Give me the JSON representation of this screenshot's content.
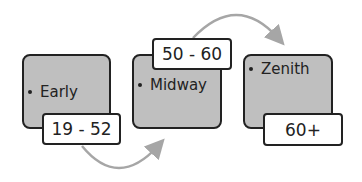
{
  "diagram": {
    "type": "process",
    "stages": [
      {
        "label": "Early",
        "range": "19 - 52"
      },
      {
        "label": "Midway",
        "range": "50 - 60"
      },
      {
        "label": "Zenith",
        "range": "60+"
      }
    ],
    "colors": {
      "block_fill": "#bfbfbf",
      "block_border": "#222222",
      "tag_fill": "#ffffff",
      "arrow": "#a6a6a6",
      "text": "#222222"
    }
  }
}
